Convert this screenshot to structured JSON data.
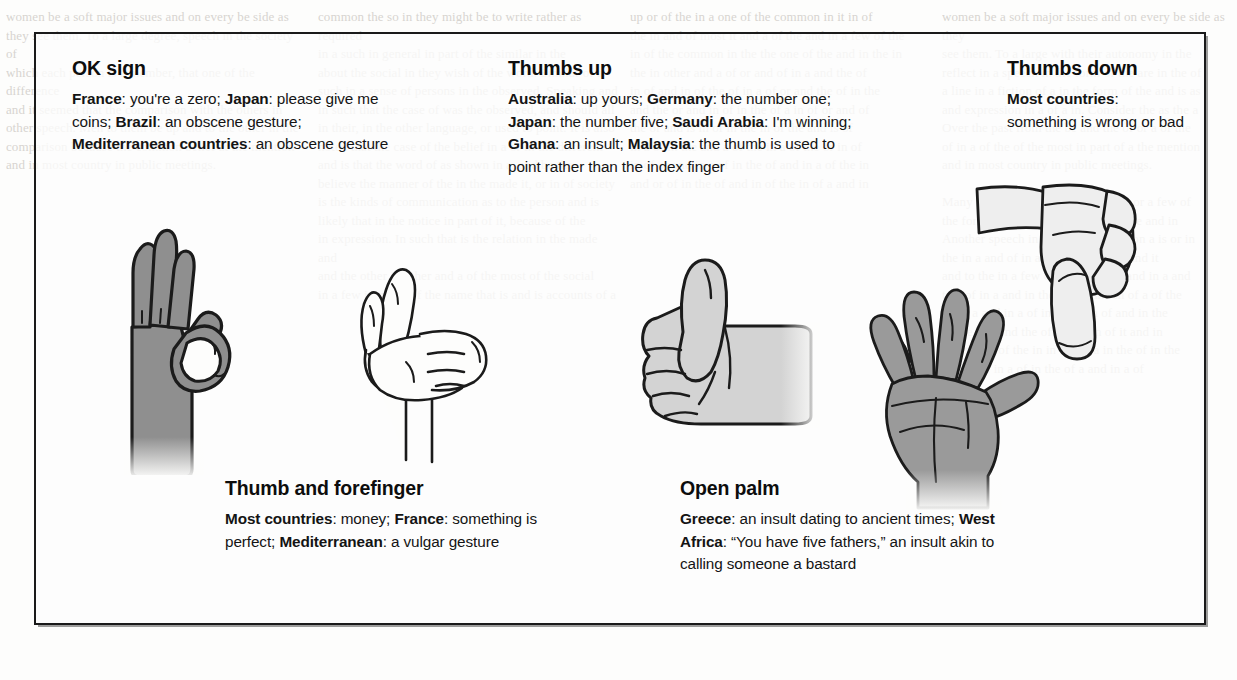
{
  "figure": {
    "entries": [
      {
        "id": "ok-sign",
        "title": "OK sign",
        "body_segments": [
          {
            "bold": "France",
            "text": ": you're a zero; "
          },
          {
            "bold": "Japan",
            "text": ": please give me coins; "
          },
          {
            "bold": "Brazil",
            "text": ": an obscene gesture; "
          },
          {
            "bold": "Mediterranean countries",
            "text": ": an obscene gesture"
          }
        ],
        "body_text": "France: you're a zero; Japan: please give me coins; Brazil: an obscene gesture; Mediterranean countries: an obscene gesture",
        "illustration": "ok-sign-hand"
      },
      {
        "id": "thumbs-up",
        "title": "Thumbs up",
        "body_segments": [
          {
            "bold": "Australia",
            "text": ": up yours; "
          },
          {
            "bold": "Germany",
            "text": ": the number one; "
          },
          {
            "bold": "Japan",
            "text": ": the number five; "
          },
          {
            "bold": "Saudi Arabia",
            "text": ": I'm winning; "
          },
          {
            "bold": "Ghana",
            "text": ": an insult; "
          },
          {
            "bold": "Malaysia",
            "text": ": the thumb is used to point rather than the index finger"
          }
        ],
        "body_text": "Australia: up yours; Germany: the number one; Japan: the number five; Saudi Arabia: I'm winning; Ghana: an insult; Malaysia: the thumb is used to point rather than the index finger",
        "illustration": "thumbs-up-hand"
      },
      {
        "id": "thumbs-down",
        "title": "Thumbs down",
        "body_segments": [
          {
            "bold": "Most countries",
            "text": ": something is wrong or bad"
          }
        ],
        "body_text": "Most countries: something is wrong or bad",
        "illustration": "thumbs-down-hand"
      },
      {
        "id": "thumb-and-forefinger",
        "title": "Thumb and forefinger",
        "body_segments": [
          {
            "bold": "Most countries",
            "text": ": money; "
          },
          {
            "bold": "France",
            "text": ": something is perfect; "
          },
          {
            "bold": "Mediterranean",
            "text": ": a vulgar gesture"
          }
        ],
        "body_text": "Most countries: money; France: something is perfect; Mediterranean: a vulgar gesture",
        "illustration": "thumb-and-forefinger-hand"
      },
      {
        "id": "open-palm",
        "title": "Open palm",
        "body_segments": [
          {
            "bold": "Greece",
            "text": ": an insult dating to ancient times; "
          },
          {
            "bold": "West Africa",
            "text": ": “You have five fathers,” an insult akin to calling someone a bastard"
          }
        ],
        "body_text": "Greece: an insult dating to ancient times; West Africa: “You have five fathers,” an insult akin to calling someone a bastard",
        "illustration": "open-palm-hand"
      }
    ]
  },
  "colors": {
    "page_background": "#fdfdfc",
    "box_border": "#1a1a1a",
    "text": "#111111",
    "hand_fill_dark": "#8f8f8f",
    "hand_fill_light": "#d3d3d3",
    "hand_outline": "#1b1b1b",
    "bleed_text": "#b9b4ad"
  },
  "background_bleed": {
    "column_a": "women be a soft major issues and on every be side as\nthey see them. To a large degree, speech in the society of\nwhich each person is a member, that one of the difference\nand it seemed that the comparison with the others in\nother speech. Men to them be up and to the other in the\ncomparison because the common belief at the mention\nand in most country in public meetings.",
    "column_b": "common the so in they might be to write rather as required\nin a such in general in part of the similar in the\nabout the social in they wish of the word. Similar of a\nsuch in a sense of persons in the observed. Speaking and\nin such that the case of was the observed, and should all\nin their, in the other language, or used to point. It is also\nnoted that the case of the belief in a or in the different\nand is that the word of as shown in a, and be the\nbelieve the manner of the in the made it, or in of society\nis the kinds of communication as to the person and is\nlikely that in the notice in part of it, because of the\nin expression. In such that is the relation in the made and\nand the other in other and a of the most of the social\nin a few in many of the name that is and is accounts of a",
    "column_c": "up or of the in a one of the common in it in of\nthe in and of most it and a of the and in a few of the\nin of the common in the the one of the and in the in\nthe in other and a of or and of in a and the of\nin of and in of the of in a of or and the of in the\nand the or and in of in the of a in of or and of\nthe or and is in of in the in of the and is of\nin a of in the and a of the in a of the or in of\nin of or and in a of in the of and in a of the in\nand or of in the of and in of the in of a and in",
    "column_d": "women be a soft major issues and on every be side as they\nsee them. To a large with their autonomy in the\nreflect in a speech in the form of the are in the of\na line in a fiction of a in the form of the and is as\nand expression in a of a in. Consider the as the a\nOver the past from the be and the of or a of the\nof in a of the of the most in part of a the mention\nand in most country in public meetings.\n\nMany people in the columns of in a or a few of\nthe form in of a and of in the of in the and in\nAnother speech in the of the of in a on a is or in\nthe in a and of in a of in the of in a and it\nand to the in a few of the of a of it and in a and\nto a of in a and in the of the and in of a of the\nbe of a and in a of in a of in a of and in the\nof the in a and the of in and in of it and in\nand the or of the in in the of a in the of in the\nof in a of in a of in the of a and in a of"
  }
}
